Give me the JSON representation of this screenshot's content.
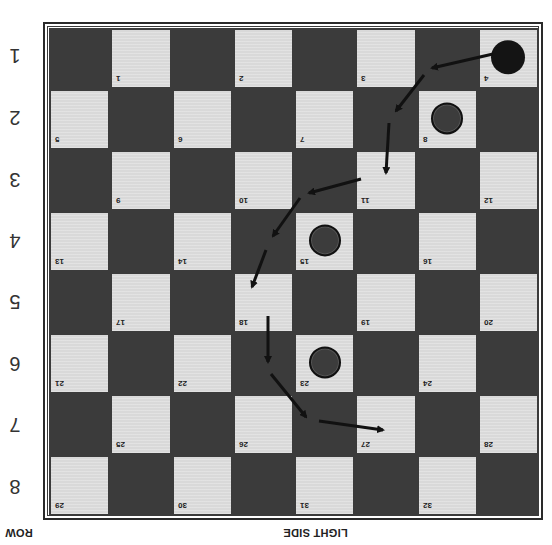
{
  "board": {
    "rows": 8,
    "cols": 8,
    "orientation": "rotated-180",
    "colors": {
      "dark": "#3b3b3b",
      "light": "#d9d9d9",
      "border": "#2a2a2a"
    },
    "squares": [
      [
        {
          "type": "dark"
        },
        {
          "type": "light",
          "num": "1"
        },
        {
          "type": "dark"
        },
        {
          "type": "light",
          "num": "2"
        },
        {
          "type": "dark"
        },
        {
          "type": "light",
          "num": "3"
        },
        {
          "type": "dark"
        },
        {
          "type": "light",
          "num": "4",
          "piece": "black"
        }
      ],
      [
        {
          "type": "light",
          "num": "5"
        },
        {
          "type": "dark"
        },
        {
          "type": "light",
          "num": "6"
        },
        {
          "type": "dark"
        },
        {
          "type": "light",
          "num": "7"
        },
        {
          "type": "dark"
        },
        {
          "type": "light",
          "num": "8",
          "piece": "outlined"
        },
        {
          "type": "dark"
        }
      ],
      [
        {
          "type": "dark"
        },
        {
          "type": "light",
          "num": "9"
        },
        {
          "type": "dark"
        },
        {
          "type": "light",
          "num": "10"
        },
        {
          "type": "dark"
        },
        {
          "type": "light",
          "num": "11"
        },
        {
          "type": "dark"
        },
        {
          "type": "light",
          "num": "12"
        }
      ],
      [
        {
          "type": "light",
          "num": "13"
        },
        {
          "type": "dark"
        },
        {
          "type": "light",
          "num": "14"
        },
        {
          "type": "dark"
        },
        {
          "type": "light",
          "num": "15",
          "piece": "outlined"
        },
        {
          "type": "dark"
        },
        {
          "type": "light",
          "num": "16"
        },
        {
          "type": "dark"
        }
      ],
      [
        {
          "type": "dark"
        },
        {
          "type": "light",
          "num": "17"
        },
        {
          "type": "dark"
        },
        {
          "type": "light",
          "num": "18"
        },
        {
          "type": "dark"
        },
        {
          "type": "light",
          "num": "19"
        },
        {
          "type": "dark"
        },
        {
          "type": "light",
          "num": "20"
        }
      ],
      [
        {
          "type": "light",
          "num": "21"
        },
        {
          "type": "dark"
        },
        {
          "type": "light",
          "num": "22"
        },
        {
          "type": "dark"
        },
        {
          "type": "light",
          "num": "23",
          "piece": "outlined"
        },
        {
          "type": "dark"
        },
        {
          "type": "light",
          "num": "24"
        },
        {
          "type": "dark"
        }
      ],
      [
        {
          "type": "dark"
        },
        {
          "type": "light",
          "num": "25"
        },
        {
          "type": "dark"
        },
        {
          "type": "light",
          "num": "26"
        },
        {
          "type": "dark"
        },
        {
          "type": "light",
          "num": "27"
        },
        {
          "type": "dark"
        },
        {
          "type": "light",
          "num": "28"
        }
      ],
      [
        {
          "type": "light",
          "num": "29"
        },
        {
          "type": "dark"
        },
        {
          "type": "light",
          "num": "30"
        },
        {
          "type": "dark"
        },
        {
          "type": "light",
          "num": "31"
        },
        {
          "type": "dark"
        },
        {
          "type": "light",
          "num": "32"
        },
        {
          "type": "dark"
        }
      ]
    ]
  },
  "pieces": [
    {
      "square": "4",
      "style": "black"
    },
    {
      "square": "8",
      "style": "outlined"
    },
    {
      "square": "15",
      "style": "outlined"
    },
    {
      "square": "23",
      "style": "outlined"
    }
  ],
  "arrows": [
    {
      "x1": 493,
      "y1": 54,
      "x2": 432,
      "y2": 68
    },
    {
      "x1": 424,
      "y1": 75,
      "x2": 396,
      "y2": 111
    },
    {
      "x1": 389,
      "y1": 123,
      "x2": 386,
      "y2": 173
    },
    {
      "x1": 361,
      "y1": 179,
      "x2": 309,
      "y2": 193
    },
    {
      "x1": 300,
      "y1": 198,
      "x2": 273,
      "y2": 236
    },
    {
      "x1": 266,
      "y1": 250,
      "x2": 252,
      "y2": 287
    },
    {
      "x1": 268,
      "y1": 316,
      "x2": 268,
      "y2": 362
    },
    {
      "x1": 271,
      "y1": 374,
      "x2": 306,
      "y2": 417
    },
    {
      "x1": 319,
      "y1": 421,
      "x2": 383,
      "y2": 430
    }
  ],
  "row_labels": [
    "1",
    "2",
    "3",
    "4",
    "5",
    "6",
    "7",
    "8"
  ],
  "footer": {
    "side_label": "LIGHT SIDE",
    "row_axis_label": "ROW"
  }
}
